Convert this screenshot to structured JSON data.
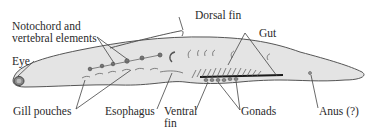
{
  "diagram": {
    "labels": {
      "notochord_line1": "Notochord and",
      "notochord_line2": "vertebral elements",
      "dorsal_fin": "Dorsal fin",
      "gut": "Gut",
      "eye": "Eye",
      "gill_pouches": "Gill pouches",
      "esophagus": "Esophagus",
      "ventral_fin_line1": "Ventral",
      "ventral_fin_line2": "fin",
      "gonads": "Gonads",
      "anus": "Anus (?)"
    },
    "colors": {
      "body_fill": "#e4e4e4",
      "outline": "#555555",
      "leader_line": "#444444",
      "text": "#2a2a2a",
      "gut_line": "#1a1a1a"
    }
  }
}
